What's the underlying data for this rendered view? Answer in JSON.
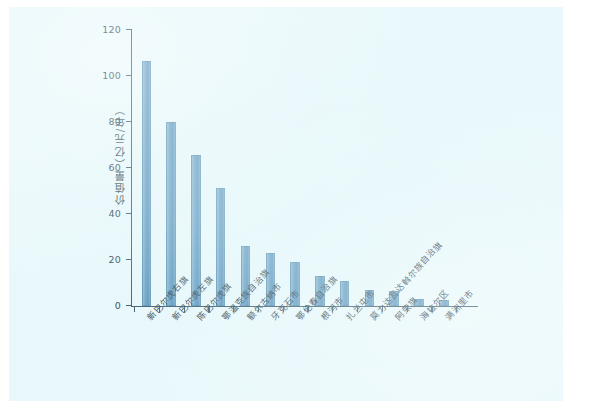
{
  "chart_data": {
    "type": "bar",
    "title": "",
    "xlabel": "",
    "ylabel": "价值量（亿元/年）",
    "ylim": [
      0,
      120
    ],
    "yticks": [
      0,
      20,
      40,
      60,
      80,
      100,
      120
    ],
    "grid": false,
    "legend": "none",
    "bar_color": "#5b96be",
    "background_color": "#e8f8fb",
    "axis_color": "#2b4f63",
    "categories": [
      "新巴尔虎右旗",
      "新巴尔虎左旗",
      "陈巴尔虎旗",
      "鄂温克族自治旗",
      "额尔古纳市",
      "牙克石市",
      "鄂伦春自治旗",
      "根河市",
      "扎兰屯市",
      "莫力达瓦达斡尔族自治旗",
      "阿荣旗",
      "海拉尔区",
      "满洲里市"
    ],
    "values": [
      106.5,
      80,
      65.5,
      51,
      26,
      23,
      19,
      13,
      10.5,
      7,
      6.5,
      3,
      2.5
    ]
  }
}
